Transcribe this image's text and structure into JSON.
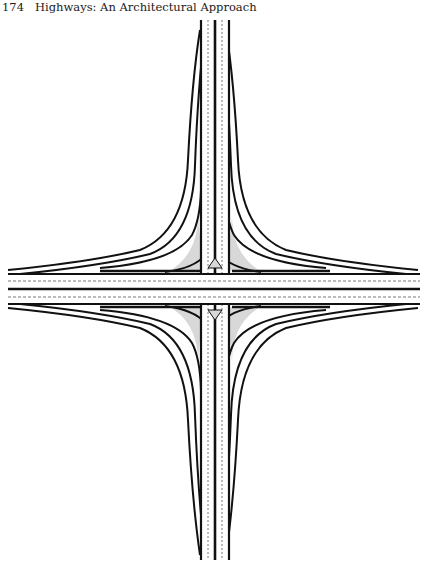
{
  "header": {
    "page_number": "174",
    "running_title": "Highways: An Architectural Approach"
  },
  "figure": {
    "colors": {
      "ink": "#111111",
      "fill": "#d8d8d8",
      "paper": "#ffffff",
      "dash": "#555555"
    }
  }
}
